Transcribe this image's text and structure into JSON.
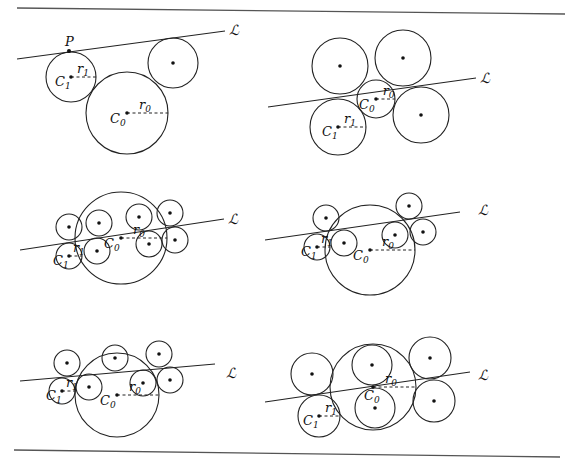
{
  "figure": {
    "rules": [
      {
        "x1": 17,
        "y1": 8,
        "x2": 565,
        "y2": 14
      },
      {
        "x1": 14,
        "y1": 450,
        "x2": 560,
        "y2": 457
      }
    ],
    "labels": {
      "line": "ℒ",
      "point": "P",
      "center_big": "C",
      "center_big_sub": "0",
      "center_small": "C",
      "center_small_sub": "1",
      "radius_big": "r",
      "radius_big_sub": "0",
      "radius_small": "r",
      "radius_small_sub": "1"
    },
    "panels": [
      {
        "id": "panel-1",
        "line": {
          "x1": 17,
          "y1": 59,
          "x2": 225,
          "y2": 31,
          "label_x": 229,
          "label_y": 35
        },
        "point_P": {
          "x": 69,
          "y": 51
        },
        "C0": {
          "x": 127,
          "y": 113,
          "r": 41
        },
        "C1": {
          "x": 71,
          "y": 77,
          "r": 25
        },
        "others": [
          {
            "x": 173,
            "y": 63,
            "r": 25
          }
        ]
      },
      {
        "id": "panel-2",
        "line": {
          "x1": 268,
          "y1": 107,
          "x2": 476,
          "y2": 78,
          "label_x": 480,
          "label_y": 83
        },
        "C0": {
          "x": 376,
          "y": 99,
          "r": 19
        },
        "C1": {
          "x": 338,
          "y": 127,
          "r": 28
        },
        "others": [
          {
            "x": 340,
            "y": 66,
            "r": 28
          },
          {
            "x": 403,
            "y": 58,
            "r": 28
          },
          {
            "x": 421,
            "y": 115,
            "r": 28
          }
        ]
      },
      {
        "id": "panel-3",
        "line": {
          "x1": 20,
          "y1": 250,
          "x2": 224,
          "y2": 219,
          "label_x": 228,
          "label_y": 224
        },
        "C0": {
          "x": 121,
          "y": 238,
          "r": 46
        },
        "C1": {
          "x": 69,
          "y": 256,
          "r": 13
        },
        "others": [
          {
            "x": 69,
            "y": 227,
            "r": 13
          },
          {
            "x": 99,
            "y": 223,
            "r": 13
          },
          {
            "x": 97,
            "y": 251,
            "r": 13
          },
          {
            "x": 139,
            "y": 217,
            "r": 13
          },
          {
            "x": 149,
            "y": 244,
            "r": 13
          },
          {
            "x": 170,
            "y": 213,
            "r": 13
          },
          {
            "x": 175,
            "y": 240,
            "r": 13
          }
        ]
      },
      {
        "id": "panel-4",
        "line": {
          "x1": 265,
          "y1": 240,
          "x2": 460,
          "y2": 212,
          "label_x": 478,
          "label_y": 215
        },
        "C0": {
          "x": 370,
          "y": 250,
          "r": 45
        },
        "C1": {
          "x": 317,
          "y": 247,
          "r": 13
        },
        "others": [
          {
            "x": 326,
            "y": 218,
            "r": 13
          },
          {
            "x": 344,
            "y": 243,
            "r": 13
          },
          {
            "x": 395,
            "y": 235,
            "r": 13
          },
          {
            "x": 409,
            "y": 206,
            "r": 13
          },
          {
            "x": 423,
            "y": 232,
            "r": 13
          }
        ]
      },
      {
        "id": "panel-5",
        "line": {
          "x1": 20,
          "y1": 381,
          "x2": 215,
          "y2": 364,
          "label_x": 226,
          "label_y": 378
        },
        "C0": {
          "x": 117,
          "y": 395,
          "r": 42
        },
        "C1": {
          "x": 62,
          "y": 391,
          "r": 13
        },
        "others": [
          {
            "x": 67,
            "y": 363,
            "r": 13
          },
          {
            "x": 89,
            "y": 387,
            "r": 13
          },
          {
            "x": 115,
            "y": 358,
            "r": 13
          },
          {
            "x": 143,
            "y": 383,
            "r": 13
          },
          {
            "x": 159,
            "y": 354,
            "r": 13
          },
          {
            "x": 170,
            "y": 380,
            "r": 13
          }
        ]
      },
      {
        "id": "panel-6",
        "line": {
          "x1": 265,
          "y1": 402,
          "x2": 470,
          "y2": 372,
          "label_x": 478,
          "label_y": 380
        },
        "C0": {
          "x": 373,
          "y": 387,
          "r": 43
        },
        "C1": {
          "x": 319,
          "y": 416,
          "r": 21
        },
        "others": [
          {
            "x": 312,
            "y": 374,
            "r": 21
          },
          {
            "x": 372,
            "y": 365,
            "r": 20
          },
          {
            "x": 375,
            "y": 408,
            "r": 20
          },
          {
            "x": 430,
            "y": 358,
            "r": 21
          },
          {
            "x": 434,
            "y": 401,
            "r": 21
          }
        ]
      }
    ]
  }
}
